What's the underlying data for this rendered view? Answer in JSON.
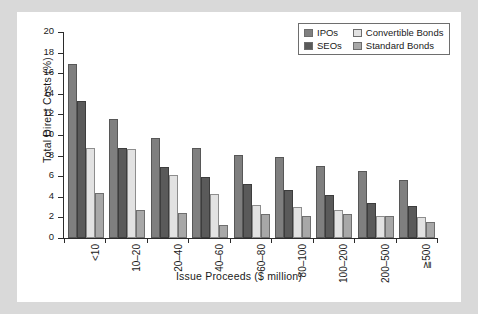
{
  "chart_data": {
    "type": "bar",
    "title": "",
    "xlabel": "Issue Proceeds ($ million)",
    "ylabel": "Total Direct Costs (%)",
    "ylim": [
      0,
      20
    ],
    "ytick_step": 2,
    "yticks": [
      "0",
      "2",
      "4",
      "6",
      "8",
      "10",
      "12",
      "14",
      "16",
      "18",
      "20"
    ],
    "grid": false,
    "legend_position": "top-right",
    "categories": [
      "<10",
      "10–20",
      "20–40",
      "40–60",
      "60–80",
      "80–100",
      "100–200",
      "200–500",
      "≧500"
    ],
    "series": [
      {
        "name": "IPOs",
        "color": "#7f7f7f",
        "values": [
          16.9,
          11.6,
          9.7,
          8.7,
          8.1,
          7.9,
          7.0,
          6.5,
          5.6
        ]
      },
      {
        "name": "SEOs",
        "color": "#5a5a5a",
        "values": [
          13.3,
          8.7,
          6.9,
          5.9,
          5.2,
          4.7,
          4.2,
          3.4,
          3.1
        ]
      },
      {
        "name": "Convertible Bonds",
        "color": "#e2e2e2",
        "values": [
          8.7,
          8.6,
          6.1,
          4.3,
          3.2,
          3.0,
          2.7,
          2.1,
          2.0
        ]
      },
      {
        "name": "Standard Bonds",
        "color": "#a8a8a8",
        "values": [
          4.4,
          2.7,
          2.4,
          1.3,
          2.3,
          2.1,
          2.3,
          2.1,
          1.55
        ]
      }
    ]
  },
  "legend": {
    "items": [
      {
        "label": "IPOs"
      },
      {
        "label": "Convertible Bonds"
      },
      {
        "label": "SEOs"
      },
      {
        "label": "Standard Bonds"
      }
    ]
  }
}
